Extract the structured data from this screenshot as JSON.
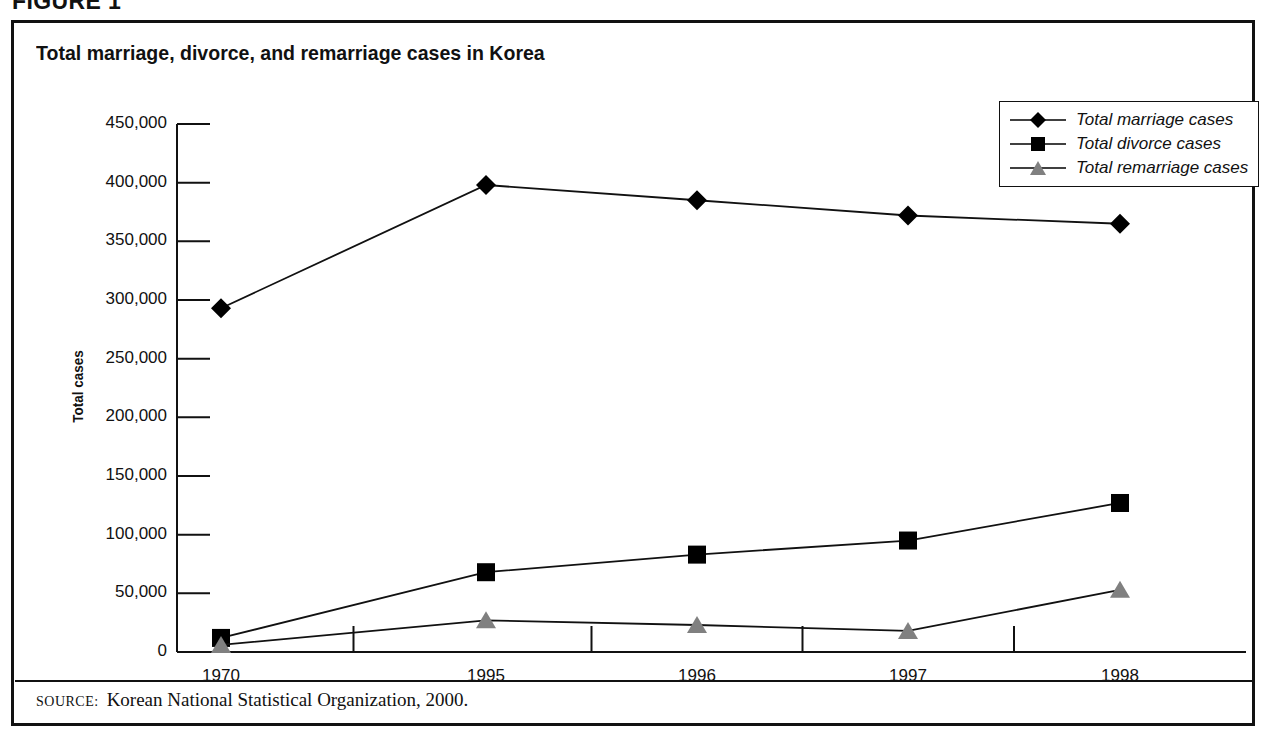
{
  "figure": {
    "label": "FIGURE 1",
    "title": "Total marriage, divorce, and remarriage cases in Korea",
    "source_kicker": "SOURCE:",
    "source_text": "Korean National Statistical Organization, 2000."
  },
  "colors": {
    "marriage": "#000000",
    "divorce": "#000000",
    "remarriage": "#808080",
    "axis": "#111111",
    "background": "#ffffff"
  },
  "chart_data": {
    "type": "line",
    "title": "Total marriage, divorce, and remarriage cases in Korea",
    "xlabel": "",
    "ylabel": "Total cases",
    "categories": [
      "1970",
      "1995",
      "1996",
      "1997",
      "1998"
    ],
    "ylim": [
      0,
      450000
    ],
    "ytick_labels": [
      "450,000",
      "400,000",
      "350,000",
      "300,000",
      "250,000",
      "200,000",
      "150,000",
      "100,000",
      "50,000",
      "0"
    ],
    "ytick_values": [
      450000,
      400000,
      350000,
      300000,
      250000,
      200000,
      150000,
      100000,
      50000,
      0
    ],
    "grid": false,
    "legend_position": "top-right",
    "series": [
      {
        "name": "Total marriage cases",
        "marker": "diamond",
        "color": "#000000",
        "values": [
          293000,
          398000,
          385000,
          372000,
          365000
        ]
      },
      {
        "name": "Total divorce cases",
        "marker": "square",
        "color": "#000000",
        "values": [
          12000,
          68000,
          83000,
          95000,
          127000
        ]
      },
      {
        "name": "Total remarriage cases",
        "marker": "triangle",
        "color": "#808080",
        "values": [
          6000,
          27000,
          23000,
          18000,
          53000
        ]
      }
    ]
  },
  "legend": {
    "items": [
      {
        "label": "Total marriage cases",
        "marker": "diamond",
        "color": "#000000"
      },
      {
        "label": "Total divorce cases",
        "marker": "square",
        "color": "#000000"
      },
      {
        "label": "Total remarriage cases",
        "marker": "triangle",
        "color": "#808080"
      }
    ]
  }
}
